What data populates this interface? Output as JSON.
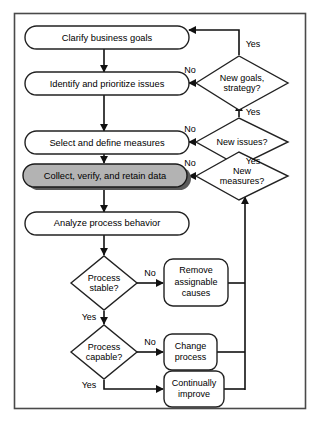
{
  "diagram": {
    "type": "flowchart",
    "colors": {
      "background": "#ffffff",
      "frame_stroke": "#4a4a4a",
      "node_stroke": "#222222",
      "connector": "#111111",
      "highlight_fill": "#b3b3b3",
      "highlight_shadow": "#5a5a5a"
    },
    "nodes": {
      "clarify_goals": {
        "label": "Clarify business goals",
        "shape": "rounded-rect",
        "highlighted": false
      },
      "identify_issues": {
        "label": "Identify and prioritize issues",
        "shape": "rounded-rect",
        "highlighted": false
      },
      "select_measures": {
        "label": "Select and define measures",
        "shape": "rounded-rect",
        "highlighted": false
      },
      "collect_data": {
        "label": "Collect, verify, and retain data",
        "shape": "rounded-rect",
        "highlighted": true
      },
      "analyze_behavior": {
        "label": "Analyze process behavior",
        "shape": "rounded-rect",
        "highlighted": false
      },
      "new_goals": {
        "label_line1": "New goals,",
        "label_line2": "strategy?",
        "shape": "diamond"
      },
      "new_issues": {
        "label_line1": "New issues?",
        "label_line2": "",
        "shape": "diamond"
      },
      "new_measures": {
        "label_line1": "New",
        "label_line2": "measures?",
        "shape": "diamond"
      },
      "process_stable": {
        "label_line1": "Process",
        "label_line2": "stable?",
        "shape": "diamond"
      },
      "process_capable": {
        "label_line1": "Process",
        "label_line2": "capable?",
        "shape": "diamond"
      },
      "remove_causes": {
        "label_line1": "Remove",
        "label_line2": "assignable",
        "label_line3": "causes",
        "shape": "rounded-rect"
      },
      "change_process": {
        "label_line1": "Change",
        "label_line2": "process",
        "shape": "rounded-rect"
      },
      "continually_improve": {
        "label_line1": "Continually",
        "label_line2": "improve",
        "shape": "rounded-rect"
      }
    },
    "edge_labels": {
      "new_goals_yes": "Yes",
      "new_goals_no": "No",
      "new_issues_yes_in": "Yes",
      "new_issues_yes_out": "Yes",
      "new_issues_no": "No",
      "new_measures_no": "No",
      "process_stable_no": "No",
      "process_stable_yes": "Yes",
      "process_capable_no": "No",
      "process_capable_yes": "Yes"
    }
  }
}
